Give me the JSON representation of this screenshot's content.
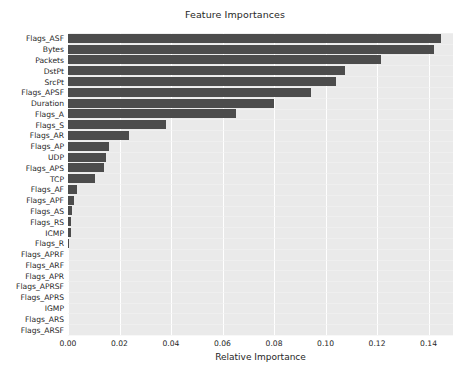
{
  "chart_data": {
    "type": "bar",
    "orientation": "horizontal",
    "title": "Feature Importances",
    "xlabel": "Relative Importance",
    "ylabel": "",
    "xlim": [
      0.0,
      0.1495
    ],
    "xticks": [
      0.0,
      0.02,
      0.04,
      0.06,
      0.08,
      0.1,
      0.12,
      0.14
    ],
    "xtick_labels": [
      "0.00",
      "0.02",
      "0.04",
      "0.06",
      "0.08",
      "0.10",
      "0.12",
      "0.14"
    ],
    "grid": true,
    "legend": null,
    "bar_color": "#4c4c4c",
    "plot_background": "#eaeaea",
    "categories": [
      "Flags_ASF",
      "Bytes",
      "Packets",
      "DstPt",
      "SrcPt",
      "Flags_APSF",
      "Duration",
      "Flags_A",
      "Flags_S",
      "Flags_AR",
      "Flags_AP",
      "UDP",
      "Flags_APS",
      "TCP",
      "Flags_AF",
      "Flags_APF",
      "Flags_AS",
      "Flags_RS",
      "ICMP",
      "Flags_R",
      "Flags_APRF",
      "Flags_ARF",
      "Flags_APR",
      "Flags_APRSF",
      "Flags_APRS",
      "IGMP",
      "Flags_ARS",
      "Flags_ARSF"
    ],
    "values": [
      0.145,
      0.1422,
      0.1214,
      0.1074,
      0.104,
      0.0944,
      0.08,
      0.0652,
      0.0382,
      0.0238,
      0.016,
      0.0148,
      0.014,
      0.0105,
      0.0035,
      0.0023,
      0.0016,
      0.0012,
      0.0011,
      0.0004,
      0.0,
      0.0,
      0.0,
      0.0,
      0.0,
      0.0,
      0.0,
      0.0
    ]
  }
}
